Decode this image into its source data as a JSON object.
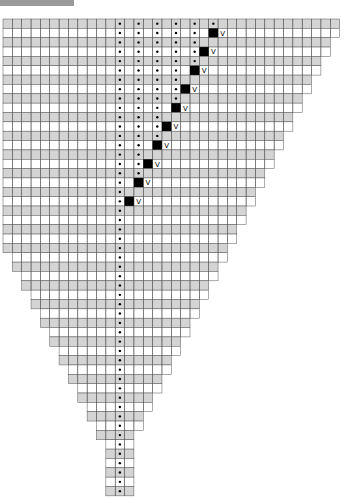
{
  "title": "",
  "chart_data": {
    "type": "table",
    "rows": 51,
    "cols": 36,
    "center_col": 12,
    "row_number_label": "13",
    "edge_number_label": "12",
    "symbols": {
      "dot": "purl",
      "black_square": "no stitch",
      "v": "increase"
    },
    "colors": {
      "gray_row": "#d4d4d4",
      "white_row": "#ffffff",
      "grid_line": "#555555",
      "black_cell": "#000000"
    }
  }
}
